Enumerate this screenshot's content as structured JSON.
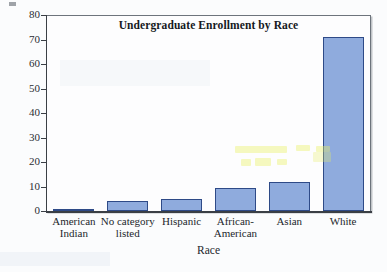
{
  "chart_data": {
    "type": "bar",
    "title": "Undergraduate Enrollment by Race",
    "xlabel": "Race",
    "ylabel": "",
    "categories": [
      "American Indian",
      "No category listed",
      "Hispanic",
      "African-American",
      "Asian",
      "White"
    ],
    "category_lines": [
      [
        "American",
        "Indian"
      ],
      [
        "No category",
        "listed"
      ],
      [
        "Hispanic"
      ],
      [
        "African-",
        "American"
      ],
      [
        "Asian"
      ],
      [
        "White"
      ]
    ],
    "values": [
      1,
      4,
      5,
      9.5,
      12,
      71
    ],
    "ylim": [
      0,
      80
    ],
    "yticks": [
      0,
      10,
      20,
      30,
      40,
      50,
      60,
      70,
      80
    ],
    "ytick_labels": [
      "0",
      "10",
      "20",
      "30",
      "40",
      "50",
      "60",
      "70",
      "80"
    ],
    "grid": false,
    "legend": "none",
    "bar_color": "#8fabdd",
    "bar_edge_color": "#2e4a87",
    "axis_color": "#3a3f45",
    "frame_color": "#6d747c",
    "background": "#fbfcfd"
  }
}
